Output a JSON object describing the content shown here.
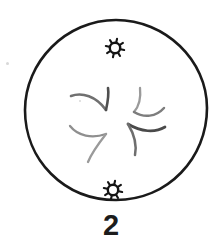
{
  "figure": {
    "kind": "hand-drawn-biology-diagram",
    "caption": "2",
    "cell": {
      "label": "cell-membrane-outline",
      "outline_color": "#1a1a1a",
      "fill_color": "#ffffff",
      "stroke_width": 2.6,
      "center_x": 116,
      "center_y": 110,
      "radius_x": 91,
      "radius_y": 90
    },
    "poles": [
      {
        "name": "centrosome-top",
        "symbol": "aster-star-icon",
        "x": 115,
        "y": 48,
        "color": "#141414",
        "ray_count": 8,
        "core_radius": 5.2,
        "ray_length": 4.2
      },
      {
        "name": "centrosome-bottom",
        "symbol": "aster-star-icon",
        "x": 113,
        "y": 190,
        "color": "#141414",
        "ray_count": 8,
        "core_radius": 5.2,
        "ray_length": 4.2
      }
    ],
    "chromosomes": {
      "label": "chromosome-arms",
      "color": "#8c8c8c",
      "dark_color": "#5a5a5a",
      "stroke_width": 2.2,
      "count": 6,
      "paths": [
        {
          "name": "arm-upper-left",
          "d": "M71 96 C 82 92, 96 96, 106 110",
          "width": 2.6,
          "color": "#707070"
        },
        {
          "name": "arm-upper-left-hook",
          "d": "M106 110 C 108 101, 109 94, 108 88",
          "width": 2.6,
          "color": "#4f4f4f"
        },
        {
          "name": "arm-lower-left",
          "d": "M70 126 C 78 136, 92 139, 106 134",
          "width": 2.3,
          "color": "#8f8f8f"
        },
        {
          "name": "arm-lower-left-tail",
          "d": "M106 134 C 99 143, 92 152, 88 162",
          "width": 2.3,
          "color": "#9a9a9a"
        },
        {
          "name": "arm-upper-right",
          "d": "M140 88 C 141 97, 140 105, 134 112",
          "width": 2.3,
          "color": "#9a9a9a"
        },
        {
          "name": "arm-upper-right-sweep",
          "d": "M134 112 C 144 118, 156 117, 164 108",
          "width": 2.5,
          "color": "#7d7d7d"
        },
        {
          "name": "arm-mid-right",
          "d": "M128 124 C 141 132, 155 133, 165 127",
          "width": 2.7,
          "color": "#4a4a4a"
        },
        {
          "name": "arm-lower-right-tail",
          "d": "M128 124 C 134 134, 137 145, 135 155",
          "width": 2.5,
          "color": "#6e6e6e"
        }
      ]
    },
    "specks": [
      {
        "name": "paper-speck-left",
        "x": 6,
        "y": 62,
        "size": 3
      },
      {
        "name": "paper-speck-center",
        "x": 79,
        "y": 100,
        "size": 2
      }
    ]
  }
}
